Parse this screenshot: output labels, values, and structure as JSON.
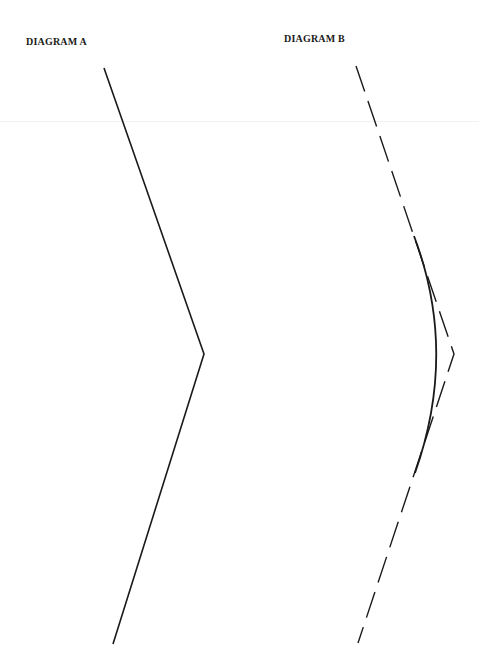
{
  "diagram_a": {
    "title": "DIAGRAM A",
    "polyline": [
      [
        104,
        68
      ],
      [
        204,
        354
      ],
      [
        113,
        644
      ]
    ],
    "stroke": "#1a1a1a",
    "style": "solid"
  },
  "diagram_b": {
    "title": "DIAGRAM B",
    "dashed_polyline": [
      [
        356,
        66
      ],
      [
        454,
        354
      ],
      [
        358,
        643
      ]
    ],
    "curve": {
      "start": [
        414,
        236
      ],
      "control": [
        458,
        352
      ],
      "end": [
        415,
        473
      ]
    },
    "stroke": "#1a1a1a",
    "dash": "27 10"
  }
}
